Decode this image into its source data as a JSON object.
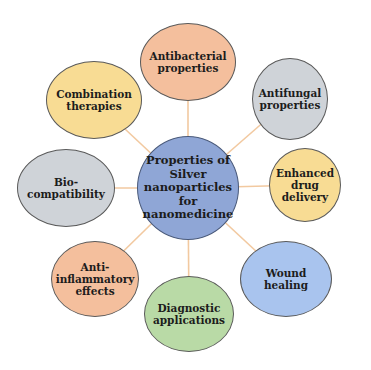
{
  "diagram": {
    "center": {
      "label": "Properties of\nSilver\nnanoparticles\nfor\nnanomedicine",
      "color": "#8fa6d6",
      "cx": 188,
      "cy": 188,
      "w": 102,
      "h": 104
    },
    "connector_color": "#f2c9a0",
    "nodes": [
      {
        "label": "Antibacterial\nproperties",
        "color": "#f4bf9d",
        "cx": 188,
        "cy": 62,
        "w": 96,
        "h": 78
      },
      {
        "label": "Antifungal\nproperties",
        "color": "#cfd3d8",
        "cx": 290,
        "cy": 99,
        "w": 76,
        "h": 82
      },
      {
        "label": "Enhanced\ndrug\ndelivery",
        "color": "#f8dc94",
        "cx": 305,
        "cy": 185,
        "w": 72,
        "h": 74
      },
      {
        "label": "Wound\nhealing",
        "color": "#a9c4ee",
        "cx": 286,
        "cy": 279,
        "w": 92,
        "h": 76
      },
      {
        "label": "Diagnostic\napplications",
        "color": "#b9daa6",
        "cx": 189,
        "cy": 314,
        "w": 90,
        "h": 76
      },
      {
        "label": "Anti-\ninflammatory\neffects",
        "color": "#f4bf9d",
        "cx": 95,
        "cy": 279,
        "w": 88,
        "h": 76
      },
      {
        "label": "Bio-\ncompatibility",
        "color": "#cfd3d8",
        "cx": 66,
        "cy": 188,
        "w": 98,
        "h": 78
      },
      {
        "label": "Combination\ntherapies",
        "color": "#f8dc94",
        "cx": 94,
        "cy": 100,
        "w": 96,
        "h": 78
      }
    ]
  }
}
